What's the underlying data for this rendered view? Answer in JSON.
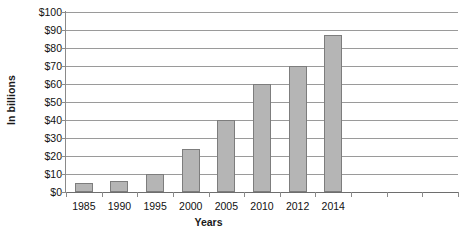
{
  "chart_data": {
    "type": "bar",
    "title": "",
    "xlabel": "Years",
    "ylabel": "In billions",
    "categories": [
      "1985",
      "1990",
      "1995",
      "2000",
      "2005",
      "2010",
      "2012",
      "2014",
      "",
      "",
      ""
    ],
    "values": [
      5,
      6,
      10,
      24,
      40,
      60,
      70,
      87,
      null,
      null,
      null
    ],
    "ylim": [
      0,
      100
    ],
    "ytick_values": [
      0,
      10,
      20,
      30,
      40,
      50,
      60,
      70,
      80,
      90,
      100
    ],
    "ytick_labels": [
      "$0",
      "$10",
      "$20",
      "$30",
      "$40",
      "$50",
      "$60",
      "$70",
      "$80",
      "$90",
      "$100"
    ],
    "grid": "horizontal",
    "legend": "none",
    "bar_color": "#b5b5b5",
    "bar_border_color": "#7d7d7d",
    "gridline_color": "#9a9a9a",
    "axis_color": "#6e6e6e",
    "text_color": "#111111"
  }
}
